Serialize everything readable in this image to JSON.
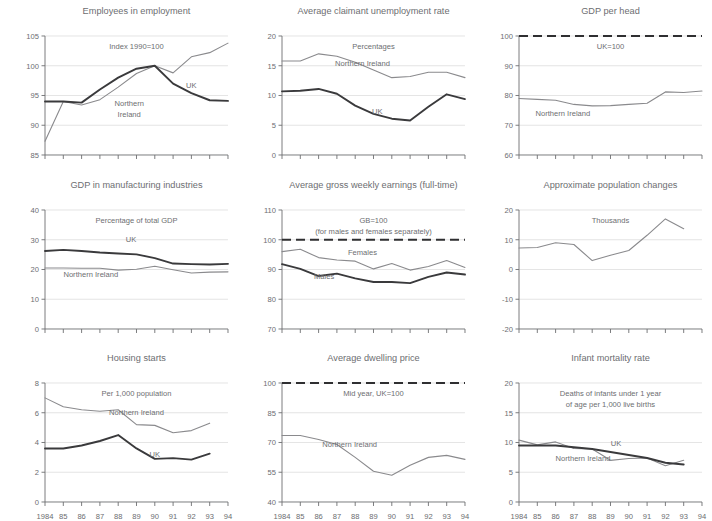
{
  "figure": {
    "x_categories": [
      "1984",
      "85",
      "86",
      "87",
      "88",
      "89",
      "90",
      "91",
      "92",
      "93",
      "94"
    ],
    "colors": {
      "dark_series": "#3a3a3c",
      "light_series": "#8a8a8d",
      "grid": "#d9d9d9",
      "axis": "#6d6e71",
      "text": "#6d6e71",
      "background": "#ffffff"
    }
  },
  "chart_data": [
    {
      "id": "employees-in-employment",
      "type": "line",
      "title": "Employees in employment",
      "subtitle": "Index 1990=100",
      "xlabel": "",
      "ylabel": "",
      "ylim": [
        85,
        105
      ],
      "yticks": [
        85,
        90,
        95,
        100,
        105
      ],
      "grid": true,
      "legend": "inline-annotations",
      "x": [
        "1984",
        "85",
        "86",
        "87",
        "88",
        "89",
        "90",
        "91",
        "92",
        "93",
        "94"
      ],
      "series": [
        {
          "name": "Northern Ireland",
          "style": "light",
          "values": [
            87.3,
            94.0,
            93.4,
            94.3,
            96.4,
            98.7,
            100.0,
            98.8,
            101.5,
            102.2,
            103.8
          ]
        },
        {
          "name": "UK",
          "style": "dark",
          "values": [
            94.0,
            94.0,
            93.8,
            96.0,
            98.0,
            99.5,
            100.0,
            97.0,
            95.4,
            94.2,
            94.1
          ]
        }
      ]
    },
    {
      "id": "average-claimant-unemployment-rate",
      "type": "line",
      "title": "Average claimant unemployment rate",
      "subtitle": "Percentages",
      "xlabel": "",
      "ylabel": "",
      "ylim": [
        0,
        20
      ],
      "yticks": [
        0,
        5,
        10,
        15,
        20
      ],
      "grid": true,
      "legend": "inline-annotations",
      "x": [
        "1984",
        "85",
        "86",
        "87",
        "88",
        "89",
        "90",
        "91",
        "92",
        "93",
        "94"
      ],
      "series": [
        {
          "name": "Northern Ireland",
          "style": "light",
          "values": [
            15.8,
            15.8,
            17.0,
            16.6,
            15.6,
            14.3,
            13.0,
            13.2,
            13.9,
            13.9,
            13.0
          ]
        },
        {
          "name": "UK",
          "style": "dark",
          "values": [
            10.7,
            10.8,
            11.1,
            10.3,
            8.3,
            6.9,
            6.1,
            5.8,
            8.1,
            10.2,
            9.4
          ]
        }
      ]
    },
    {
      "id": "gdp-per-head",
      "type": "line",
      "title": "GDP per head",
      "subtitle": "UK=100",
      "xlabel": "",
      "ylabel": "",
      "ylim": [
        60,
        100
      ],
      "yticks": [
        60,
        70,
        80,
        90,
        100
      ],
      "grid": true,
      "legend": "inline-annotations",
      "x": [
        "1984",
        "85",
        "86",
        "87",
        "88",
        "89",
        "90",
        "91",
        "92",
        "93",
        "94"
      ],
      "series": [
        {
          "name": "UK=100 reference",
          "style": "dashed",
          "values": [
            100,
            100,
            100,
            100,
            100,
            100,
            100,
            100,
            100,
            100,
            100
          ]
        },
        {
          "name": "Northern Ireland",
          "style": "light",
          "values": [
            79.0,
            78.7,
            78.4,
            77.0,
            76.5,
            76.6,
            77.0,
            77.4,
            81.2,
            81.0,
            81.5
          ]
        }
      ]
    },
    {
      "id": "gdp-in-manufacturing-industries",
      "type": "line",
      "title": "GDP in manufacturing industries",
      "subtitle": "Percentage of total GDP",
      "xlabel": "",
      "ylabel": "",
      "ylim": [
        0,
        40
      ],
      "yticks": [
        0,
        10,
        20,
        30,
        40
      ],
      "grid": true,
      "legend": "inline-annotations",
      "x": [
        "1984",
        "85",
        "86",
        "87",
        "88",
        "89",
        "90",
        "91",
        "92",
        "93",
        "94"
      ],
      "series": [
        {
          "name": "UK",
          "style": "dark",
          "values": [
            26.2,
            26.6,
            26.2,
            25.7,
            25.4,
            25.1,
            23.8,
            22.0,
            21.8,
            21.7,
            21.9
          ]
        },
        {
          "name": "Northern Ireland",
          "style": "light",
          "values": [
            20.5,
            20.5,
            20.4,
            20.4,
            19.8,
            20.1,
            21.1,
            19.9,
            18.8,
            19.1,
            19.2
          ]
        }
      ]
    },
    {
      "id": "average-gross-weekly-earnings",
      "type": "line",
      "title": "Average gross weekly earnings (full-time)",
      "subtitle": "GB=100",
      "subtitle2": "(for males and females separately)",
      "xlabel": "",
      "ylabel": "",
      "ylim": [
        70,
        110
      ],
      "yticks": [
        70,
        80,
        90,
        100,
        110
      ],
      "grid": true,
      "legend": "inline-annotations",
      "x": [
        "1984",
        "85",
        "86",
        "87",
        "88",
        "89",
        "90",
        "91",
        "92",
        "93",
        "94"
      ],
      "series": [
        {
          "name": "GB=100 reference",
          "style": "dashed",
          "values": [
            100,
            100,
            100,
            100,
            100,
            100,
            100,
            100,
            100,
            100,
            100
          ]
        },
        {
          "name": "Females",
          "style": "light",
          "values": [
            96.0,
            96.8,
            94.0,
            93.2,
            92.8,
            90.2,
            92.0,
            89.8,
            91.0,
            93.0,
            90.7
          ]
        },
        {
          "name": "Males",
          "style": "dark",
          "values": [
            91.8,
            90.2,
            87.8,
            88.6,
            87.0,
            85.8,
            85.8,
            85.4,
            87.5,
            89.0,
            88.3
          ]
        }
      ]
    },
    {
      "id": "approximate-population-changes",
      "type": "line",
      "title": "Approximate population changes",
      "subtitle": "Thousands",
      "xlabel": "",
      "ylabel": "",
      "ylim": [
        -20,
        20
      ],
      "yticks": [
        -20,
        -10,
        0,
        10,
        20
      ],
      "grid": true,
      "legend": "none",
      "x": [
        "1984",
        "85",
        "86",
        "87",
        "88",
        "89",
        "90",
        "91",
        "92",
        "93"
      ],
      "series": [
        {
          "name": "Northern Ireland",
          "style": "light",
          "values": [
            7.2,
            7.4,
            9.0,
            8.4,
            3.0,
            4.8,
            6.4,
            11.5,
            17.0,
            13.7
          ]
        }
      ]
    },
    {
      "id": "housing-starts",
      "type": "line",
      "title": "Housing starts",
      "subtitle": "Per 1,000 population",
      "xlabel": "",
      "ylabel": "",
      "ylim": [
        0,
        8
      ],
      "yticks": [
        0,
        2,
        4,
        6,
        8
      ],
      "grid": true,
      "legend": "inline-annotations",
      "x": [
        "1984",
        "85",
        "86",
        "87",
        "88",
        "89",
        "90",
        "91",
        "92",
        "93"
      ],
      "series": [
        {
          "name": "Northern Ireland",
          "style": "light",
          "values": [
            7.0,
            6.4,
            6.2,
            6.1,
            6.2,
            5.2,
            5.15,
            4.65,
            4.8,
            5.3
          ]
        },
        {
          "name": "UK",
          "style": "dark",
          "values": [
            3.6,
            3.6,
            3.8,
            4.1,
            4.5,
            3.6,
            2.9,
            2.95,
            2.85,
            3.25
          ]
        }
      ]
    },
    {
      "id": "average-dwelling-price",
      "type": "line",
      "title": "Average dwelling price",
      "subtitle": "Mid year, UK=100",
      "xlabel": "",
      "ylabel": "",
      "ylim": [
        40,
        100
      ],
      "yticks": [
        40,
        55,
        70,
        85,
        100
      ],
      "grid": true,
      "legend": "inline-annotations",
      "x": [
        "1984",
        "85",
        "86",
        "87",
        "88",
        "89",
        "90",
        "91",
        "92",
        "93",
        "94"
      ],
      "series": [
        {
          "name": "UK=100 reference",
          "style": "dashed",
          "values": [
            100,
            100,
            100,
            100,
            100,
            100,
            100,
            100,
            100,
            100,
            100
          ]
        },
        {
          "name": "Northern Ireland",
          "style": "light",
          "values": [
            73.5,
            73.5,
            71.5,
            69.0,
            62.5,
            55.5,
            53.5,
            58.5,
            62.5,
            63.5,
            61.5
          ]
        }
      ]
    },
    {
      "id": "infant-mortality-rate",
      "type": "line",
      "title": "Infant mortality rate",
      "subtitle": "Deaths of infants under 1 year",
      "subtitle2": "of age per 1,000 live births",
      "xlabel": "",
      "ylabel": "",
      "ylim": [
        0,
        20
      ],
      "yticks": [
        0,
        5,
        10,
        15,
        20
      ],
      "grid": true,
      "legend": "inline-annotations",
      "x": [
        "1984",
        "85",
        "86",
        "87",
        "88",
        "89",
        "90",
        "91",
        "92",
        "93"
      ],
      "series": [
        {
          "name": "Northern Ireland",
          "style": "light",
          "values": [
            10.4,
            9.6,
            10.1,
            9.0,
            8.9,
            7.0,
            7.3,
            7.4,
            6.1,
            7.0
          ]
        },
        {
          "name": "UK",
          "style": "dark",
          "values": [
            9.5,
            9.5,
            9.5,
            9.2,
            8.9,
            8.4,
            7.9,
            7.4,
            6.6,
            6.3
          ]
        }
      ]
    }
  ],
  "annotations": {
    "employees-in-employment": [
      {
        "text": "Northern",
        "x": 0.46,
        "y": 0.59
      },
      {
        "text": "Ireland",
        "x": 0.46,
        "y": 0.68
      },
      {
        "text": "UK",
        "x": 0.8,
        "y": 0.44
      }
    ],
    "average-claimant-unemployment-rate": [
      {
        "text": "Northern Ireland",
        "x": 0.44,
        "y": 0.25
      },
      {
        "text": "UK",
        "x": 0.52,
        "y": 0.66
      }
    ],
    "gdp-per-head": [
      {
        "text": "Northern Ireland",
        "x": 0.24,
        "y": 0.67
      }
    ],
    "gdp-in-manufacturing-industries": [
      {
        "text": "UK",
        "x": 0.47,
        "y": 0.27
      },
      {
        "text": "Northern Ireland",
        "x": 0.25,
        "y": 0.56
      }
    ],
    "average-gross-weekly-earnings": [
      {
        "text": "Females",
        "x": 0.44,
        "y": 0.38
      },
      {
        "text": "Males",
        "x": 0.23,
        "y": 0.58
      }
    ],
    "approximate-population-changes": [],
    "housing-starts": [
      {
        "text": "Northern Ireland",
        "x": 0.5,
        "y": 0.27
      },
      {
        "text": "UK",
        "x": 0.6,
        "y": 0.62
      }
    ],
    "average-dwelling-price": [
      {
        "text": "Northern Ireland",
        "x": 0.37,
        "y": 0.54
      }
    ],
    "infant-mortality-rate": [
      {
        "text": "UK",
        "x": 0.53,
        "y": 0.53
      },
      {
        "text": "Northern Ireland",
        "x": 0.35,
        "y": 0.66
      }
    ]
  }
}
